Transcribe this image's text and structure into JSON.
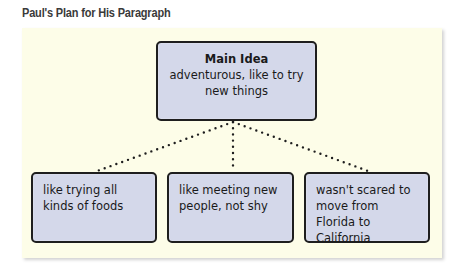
{
  "title": "Paul's Plan for His Paragraph",
  "main_idea": {
    "heading": "Main Idea",
    "text": "adventurous, like to try new things"
  },
  "details": [
    {
      "text": "like trying all kinds of foods"
    },
    {
      "text": "like meeting new people, not shy"
    },
    {
      "text": "wasn't scared to move from Florida to California"
    }
  ],
  "colors": {
    "panel_background": "#fdfde8",
    "box_fill": "#d4d8ea",
    "box_border": "#1e1e1e",
    "title_text": "#3a3a3a",
    "connector_dots": "#1e1e1e"
  },
  "connectors": {
    "style": "dotted",
    "origin": [
      233,
      121
    ],
    "targets": [
      [
        97,
        172
      ],
      [
        233,
        172
      ],
      [
        368,
        172
      ]
    ]
  }
}
